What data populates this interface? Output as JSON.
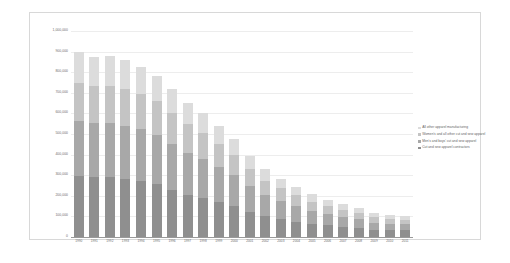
{
  "chart_data": {
    "type": "bar",
    "stacked": true,
    "title": "",
    "xlabel": "",
    "ylabel": "",
    "ylim": [
      0,
      1000000
    ],
    "grid": true,
    "legend_position": "right",
    "categories": [
      "1990",
      "1991",
      "1992",
      "1993",
      "1994",
      "1995",
      "1996",
      "1997",
      "1998",
      "1999",
      "2000",
      "2001",
      "2002",
      "2003",
      "2004",
      "2005",
      "2006",
      "2007",
      "2008",
      "2009",
      "2010",
      "2011"
    ],
    "ytick_labels": [
      "1,000,000",
      "900,000",
      "800,000",
      "700,000",
      "600,000",
      "500,000",
      "400,000",
      "300,000",
      "200,000",
      "100,000",
      "0"
    ],
    "ytick_values": [
      1000000,
      900000,
      800000,
      700000,
      600000,
      500000,
      400000,
      300000,
      200000,
      100000,
      0
    ],
    "series": [
      {
        "name": "Cut and sew apparel contractors",
        "color": "#8f8f8f",
        "values": [
          295000,
          292000,
          292000,
          283000,
          272000,
          255000,
          228000,
          205000,
          188000,
          168000,
          150000,
          122000,
          100000,
          86000,
          74000,
          64000,
          56000,
          50000,
          44000,
          36000,
          34000,
          33000
        ]
      },
      {
        "name": "Men's and boys' cut and sew apparel",
        "color": "#a8a8a8",
        "values": [
          270000,
          262000,
          262000,
          258000,
          250000,
          240000,
          222000,
          205000,
          192000,
          172000,
          150000,
          124000,
          104000,
          90000,
          76000,
          64000,
          55000,
          48000,
          42000,
          34000,
          31000,
          30000
        ]
      },
      {
        "name": "Women's and all other cut and sew apparel",
        "color": "#c4c4c4",
        "values": [
          185000,
          180000,
          180000,
          178000,
          172000,
          164000,
          152000,
          138000,
          126000,
          112000,
          98000,
          82000,
          70000,
          60000,
          52000,
          44000,
          38000,
          34000,
          30000,
          25000,
          23000,
          22000
        ]
      },
      {
        "name": "All other apparel manufacturing",
        "color": "#dcdcdc",
        "values": [
          148000,
          142000,
          144000,
          139000,
          133000,
          124000,
          115000,
          105000,
          96000,
          86000,
          76000,
          64000,
          55000,
          48000,
          42000,
          36000,
          32000,
          28000,
          25000,
          21000,
          20000,
          19000
        ]
      }
    ],
    "totals": [
      898000,
      876000,
      878000,
      858000,
      827000,
      783000,
      717000,
      653000,
      602000,
      538000,
      474000,
      392000,
      329000,
      284000,
      244000,
      208000,
      181000,
      160000,
      141000,
      116000,
      108000,
      104000
    ]
  },
  "legend": {
    "items": [
      {
        "label": "All other apparel manufacturing",
        "color": "#dcdcdc"
      },
      {
        "label": "Women's and all other cut and sew apparel",
        "color": "#c4c4c4"
      },
      {
        "label": "Men's and boys' cut and sew apparel",
        "color": "#a8a8a8"
      },
      {
        "label": "Cut and sew apparel contractors",
        "color": "#8f8f8f"
      }
    ]
  }
}
